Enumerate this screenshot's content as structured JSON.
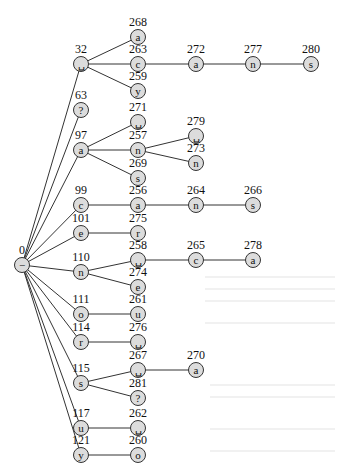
{
  "diagram": {
    "type": "trie",
    "colors": {
      "node_fill": "#dcdcdc",
      "node_stroke": "#333333",
      "edge": "#333333",
      "text": "#111111"
    },
    "nodes": [
      {
        "id": 0,
        "symbol": "−",
        "parent": null
      },
      {
        "id": 32,
        "symbol": "␣",
        "parent": 0
      },
      {
        "id": 63,
        "symbol": "?",
        "parent": 0
      },
      {
        "id": 97,
        "symbol": "a",
        "parent": 0
      },
      {
        "id": 99,
        "symbol": "c",
        "parent": 0
      },
      {
        "id": 101,
        "symbol": "e",
        "parent": 0
      },
      {
        "id": 110,
        "symbol": "n",
        "parent": 0
      },
      {
        "id": 111,
        "symbol": "o",
        "parent": 0
      },
      {
        "id": 114,
        "symbol": "r",
        "parent": 0
      },
      {
        "id": 115,
        "symbol": "s",
        "parent": 0
      },
      {
        "id": 117,
        "symbol": "u",
        "parent": 0
      },
      {
        "id": 121,
        "symbol": "y",
        "parent": 0
      },
      {
        "id": 268,
        "symbol": "a",
        "parent": 32
      },
      {
        "id": 263,
        "symbol": "c",
        "parent": 32
      },
      {
        "id": 259,
        "symbol": "y",
        "parent": 32
      },
      {
        "id": 272,
        "symbol": "a",
        "parent": 263
      },
      {
        "id": 277,
        "symbol": "n",
        "parent": 272
      },
      {
        "id": 280,
        "symbol": "s",
        "parent": 277
      },
      {
        "id": 271,
        "symbol": "␣",
        "parent": 97
      },
      {
        "id": 257,
        "symbol": "n",
        "parent": 97
      },
      {
        "id": 269,
        "symbol": "s",
        "parent": 97
      },
      {
        "id": 279,
        "symbol": "␣",
        "parent": 257
      },
      {
        "id": 273,
        "symbol": "n",
        "parent": 257
      },
      {
        "id": 256,
        "symbol": "a",
        "parent": 99
      },
      {
        "id": 264,
        "symbol": "n",
        "parent": 256
      },
      {
        "id": 266,
        "symbol": "s",
        "parent": 264
      },
      {
        "id": 275,
        "symbol": "r",
        "parent": 101
      },
      {
        "id": 258,
        "symbol": "␣",
        "parent": 110
      },
      {
        "id": 274,
        "symbol": "e",
        "parent": 110
      },
      {
        "id": 265,
        "symbol": "c",
        "parent": 258
      },
      {
        "id": 278,
        "symbol": "a",
        "parent": 265
      },
      {
        "id": 261,
        "symbol": "u",
        "parent": 111
      },
      {
        "id": 276,
        "symbol": "␣",
        "parent": 114
      },
      {
        "id": 267,
        "symbol": "␣",
        "parent": 115
      },
      {
        "id": 281,
        "symbol": "?",
        "parent": 115
      },
      {
        "id": 270,
        "symbol": "a",
        "parent": 267
      },
      {
        "id": 262,
        "symbol": "␣",
        "parent": 117
      },
      {
        "id": 260,
        "symbol": "o",
        "parent": 121
      }
    ]
  }
}
